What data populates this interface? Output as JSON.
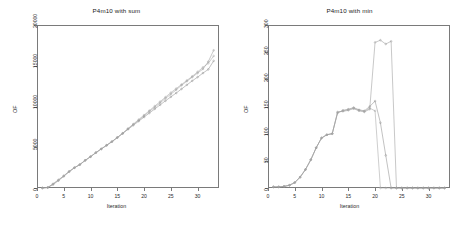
{
  "figure": {
    "background": "#ffffff",
    "panel_count": 2
  },
  "chart_data": [
    {
      "type": "line",
      "title": "P4m10 with sum",
      "xlabel": "Iteration",
      "ylabel": "OF",
      "xlim": [
        0,
        34
      ],
      "ylim": [
        0,
        20000
      ],
      "xticks": [
        0,
        5,
        10,
        15,
        20,
        25,
        30
      ],
      "yticks": [
        0,
        5000,
        10000,
        15000,
        20000
      ],
      "grid": false,
      "legend": "none",
      "marker": "point",
      "colors": [
        "#9a9a9a",
        "#8f8f8f",
        "#a5a5a5"
      ],
      "x": [
        1,
        2,
        3,
        4,
        5,
        6,
        7,
        8,
        9,
        10,
        11,
        12,
        13,
        14,
        15,
        16,
        17,
        18,
        19,
        20,
        21,
        22,
        23,
        24,
        25,
        26,
        27,
        28,
        29,
        30,
        31,
        32,
        33
      ],
      "series": [
        {
          "name": "run-1",
          "values": [
            0,
            60,
            520,
            1000,
            1500,
            2050,
            2500,
            2880,
            3400,
            3850,
            4350,
            4800,
            5250,
            5700,
            6200,
            6700,
            7250,
            7800,
            8300,
            8850,
            9400,
            9900,
            10450,
            11000,
            11500,
            12050,
            12600,
            13100,
            13600,
            14100,
            14600,
            15500,
            16900
          ]
        },
        {
          "name": "run-2",
          "values": [
            0,
            60,
            420,
            900,
            1430,
            1980,
            2480,
            2860,
            3380,
            3830,
            4330,
            4780,
            5230,
            5680,
            6180,
            6680,
            7200,
            7700,
            8200,
            8700,
            9200,
            9700,
            10200,
            10700,
            11180,
            11650,
            12150,
            12650,
            13150,
            13600,
            14100,
            14550,
            15600
          ]
        },
        {
          "name": "run-3",
          "values": [
            0,
            60,
            470,
            960,
            1470,
            2020,
            2490,
            2870,
            3390,
            3840,
            4340,
            4790,
            5240,
            5690,
            6190,
            6720,
            7300,
            7850,
            8400,
            8950,
            9500,
            10050,
            10600,
            11150,
            11700,
            12200,
            12700,
            13200,
            13700,
            14250,
            14800,
            15300,
            16200
          ]
        }
      ]
    },
    {
      "type": "line",
      "title": "P4m10 with min",
      "xlabel": "Iteration",
      "ylabel": "OF",
      "xlim": [
        0,
        34
      ],
      "ylim": [
        0,
        300
      ],
      "xticks": [
        0,
        5,
        10,
        15,
        20,
        25,
        30
      ],
      "yticks": [
        0,
        50,
        100,
        150,
        200,
        250,
        300
      ],
      "grid": false,
      "legend": "none",
      "marker": "point",
      "colors": [
        "#9a9a9a",
        "#8f8f8f",
        "#a5a5a5"
      ],
      "x": [
        1,
        2,
        3,
        4,
        5,
        6,
        7,
        8,
        9,
        10,
        11,
        12,
        13,
        14,
        15,
        16,
        17,
        18,
        19,
        20,
        21,
        22,
        23,
        24,
        25,
        26,
        27,
        28,
        29,
        30,
        31,
        32,
        33
      ],
      "series": [
        {
          "name": "run-1",
          "values": [
            2,
            2,
            3,
            5,
            10,
            20,
            34,
            52,
            74,
            92,
            98,
            100,
            140,
            141,
            143,
            146,
            142,
            140,
            145,
            268,
            272,
            265,
            270,
            0,
            0,
            0,
            0,
            0,
            0,
            0,
            0,
            0,
            0
          ]
        },
        {
          "name": "run-2",
          "values": [
            2,
            2,
            3,
            5,
            10,
            20,
            34,
            52,
            74,
            92,
            98,
            100,
            138,
            143,
            145,
            148,
            144,
            142,
            150,
            160,
            120,
            60,
            0,
            0,
            0,
            0,
            0,
            0,
            0,
            0,
            0,
            0,
            0
          ]
        },
        {
          "name": "run-3",
          "values": [
            2,
            2,
            3,
            5,
            10,
            20,
            34,
            52,
            74,
            92,
            98,
            100,
            139,
            142,
            144,
            147,
            143,
            141,
            147,
            142,
            0,
            0,
            0,
            0,
            0,
            0,
            0,
            0,
            0,
            0,
            0,
            0,
            0
          ]
        }
      ]
    }
  ]
}
